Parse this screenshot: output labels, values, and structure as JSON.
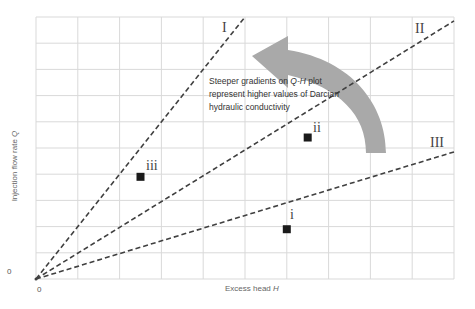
{
  "chart_data": {
    "type": "scatter",
    "title": "",
    "xlabel": "Excess head H",
    "ylabel": "Injection flow rate Q",
    "x_tick_labels": [
      "0"
    ],
    "y_tick_labels": [
      "0"
    ],
    "xlim": [
      0,
      10
    ],
    "ylim": [
      0,
      10
    ],
    "grid": true,
    "grid_divisions": {
      "x": 10,
      "y": 10
    },
    "lines": [
      {
        "name": "I",
        "style": "dashed",
        "x": [
          0,
          5.0
        ],
        "y": [
          0,
          10.0
        ],
        "slope": 2.0
      },
      {
        "name": "II",
        "style": "dashed",
        "x": [
          0,
          10.0
        ],
        "y": [
          0,
          9.85
        ],
        "slope": 1.0
      },
      {
        "name": "III",
        "style": "dashed",
        "x": [
          0,
          10.0
        ],
        "y": [
          0,
          4.85
        ],
        "slope": 0.5
      }
    ],
    "points": [
      {
        "label": "i",
        "x": 6.0,
        "y": 1.9
      },
      {
        "label": "ii",
        "x": 6.5,
        "y": 5.4
      },
      {
        "label": "iii",
        "x": 2.5,
        "y": 3.9
      }
    ],
    "annotations": [
      {
        "text": "Steeper gradients on Q-H plot represent higher values of Darcian hydraulic conductivity",
        "x": 5.2,
        "y": 7.3
      },
      {
        "type": "curved-arrow",
        "direction": "counter-clockwise",
        "from": "lower-right",
        "to": "upper-left",
        "color": "#a9a9a9"
      }
    ]
  },
  "labels": {
    "line_I": "I",
    "line_II": "II",
    "line_III": "III",
    "point_i": "i",
    "point_ii": "ii",
    "point_iii": "iii",
    "x_axis": "Excess head ",
    "x_axis_var": "H",
    "y_axis": "Injection flow rate ",
    "y_axis_var": "Q",
    "x_zero": "0",
    "y_zero": "0",
    "annotation_1": "Steeper gradients on ",
    "annotation_var": "Q-H",
    "annotation_2": " plot represent higher values of Darcian hydraulic conductivity"
  },
  "colors": {
    "grid": "#d9d9d9",
    "line": "#404040",
    "marker": "#1a1a1a",
    "arrow": "#a9a9a9"
  }
}
